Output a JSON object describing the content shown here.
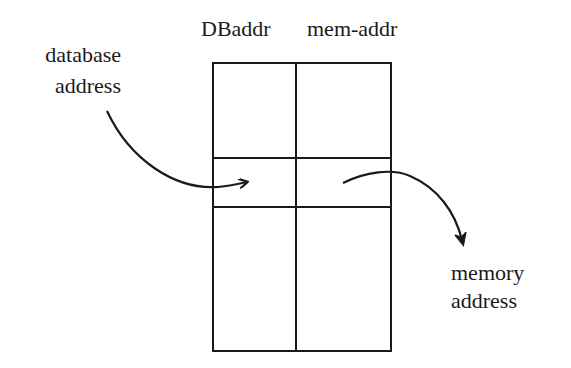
{
  "diagram": {
    "columns": [
      {
        "label": "DBaddr"
      },
      {
        "label": "mem-addr"
      }
    ],
    "table": {
      "rows": 3,
      "highlighted_row_index": 1
    },
    "annotations": {
      "input": {
        "line1": "database",
        "line2": "address"
      },
      "output": {
        "line1": "memory",
        "line2": "address"
      }
    },
    "colors": {
      "stroke": "#1a1a1a",
      "background": "#ffffff"
    }
  }
}
